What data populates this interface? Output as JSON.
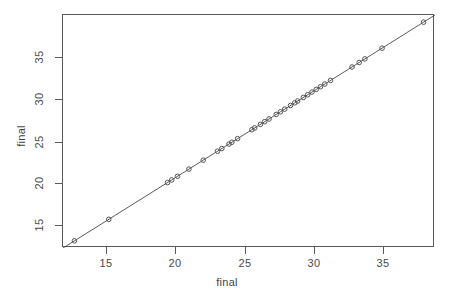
{
  "chart_data": {
    "type": "scatter",
    "title": "",
    "subtitle": "",
    "xlabel": "final",
    "ylabel": "final",
    "xlim": [
      12.2,
      38.2
    ],
    "ylim": [
      12.2,
      38.2
    ],
    "grid": false,
    "legend": null,
    "x_ticks": [
      15,
      20,
      25,
      30,
      35
    ],
    "y_ticks": [
      15,
      20,
      25,
      30,
      35
    ],
    "x_tick_labels": [
      "15",
      "20",
      "25",
      "30",
      "35"
    ],
    "y_tick_labels": [
      "15",
      "20",
      "25",
      "30",
      "35"
    ],
    "series": [
      {
        "name": "final vs final",
        "marker": "open-circle",
        "marker_color": "#555555",
        "x": [
          13.0,
          15.4,
          19.5,
          19.8,
          20.2,
          21.0,
          22.0,
          23.0,
          23.3,
          23.8,
          24.0,
          24.4,
          25.4,
          25.6,
          26.0,
          26.3,
          26.6,
          27.1,
          27.4,
          27.7,
          28.1,
          28.4,
          28.6,
          29.0,
          29.3,
          29.6,
          29.9,
          30.2,
          30.5,
          30.9,
          32.4,
          32.9,
          33.3,
          34.5,
          37.4
        ],
        "y": [
          13.0,
          15.4,
          19.5,
          19.8,
          20.2,
          21.0,
          22.0,
          23.0,
          23.3,
          23.8,
          24.0,
          24.4,
          25.4,
          25.6,
          26.0,
          26.3,
          26.6,
          27.1,
          27.4,
          27.7,
          28.1,
          28.4,
          28.6,
          29.0,
          29.3,
          29.6,
          29.9,
          30.2,
          30.5,
          30.9,
          32.4,
          32.9,
          33.3,
          34.5,
          37.4
        ]
      }
    ],
    "reference_line": {
      "name": "identity-line",
      "type": "line",
      "color": "#4a4a4a",
      "x": [
        12.2,
        38.2
      ],
      "y": [
        12.2,
        38.2
      ]
    },
    "colors": {
      "axis": "#5a5a5a",
      "point": "#555555",
      "line": "#4a4a4a",
      "background": "#ffffff",
      "text": "#4a4a4a"
    }
  },
  "axes": {
    "x_title": "final",
    "y_title": "final"
  }
}
